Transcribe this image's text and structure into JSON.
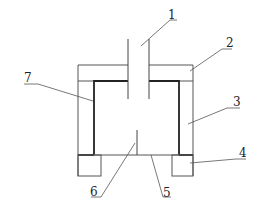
{
  "diagram": {
    "type": "technical schematic cross-section",
    "colors": {
      "line": "#555555",
      "thick_line": "#222222",
      "background": "#ffffff"
    },
    "labels": [
      {
        "id": "1",
        "text": "1",
        "part": "inlet tube"
      },
      {
        "id": "2",
        "text": "2",
        "part": "top cover"
      },
      {
        "id": "3",
        "text": "3",
        "part": "outer side wall"
      },
      {
        "id": "4",
        "text": "4",
        "part": "support foot"
      },
      {
        "id": "5",
        "text": "5",
        "part": "bottom plate"
      },
      {
        "id": "6",
        "text": "6",
        "part": "center rod"
      },
      {
        "id": "7",
        "text": "7",
        "part": "inner lining"
      }
    ]
  }
}
